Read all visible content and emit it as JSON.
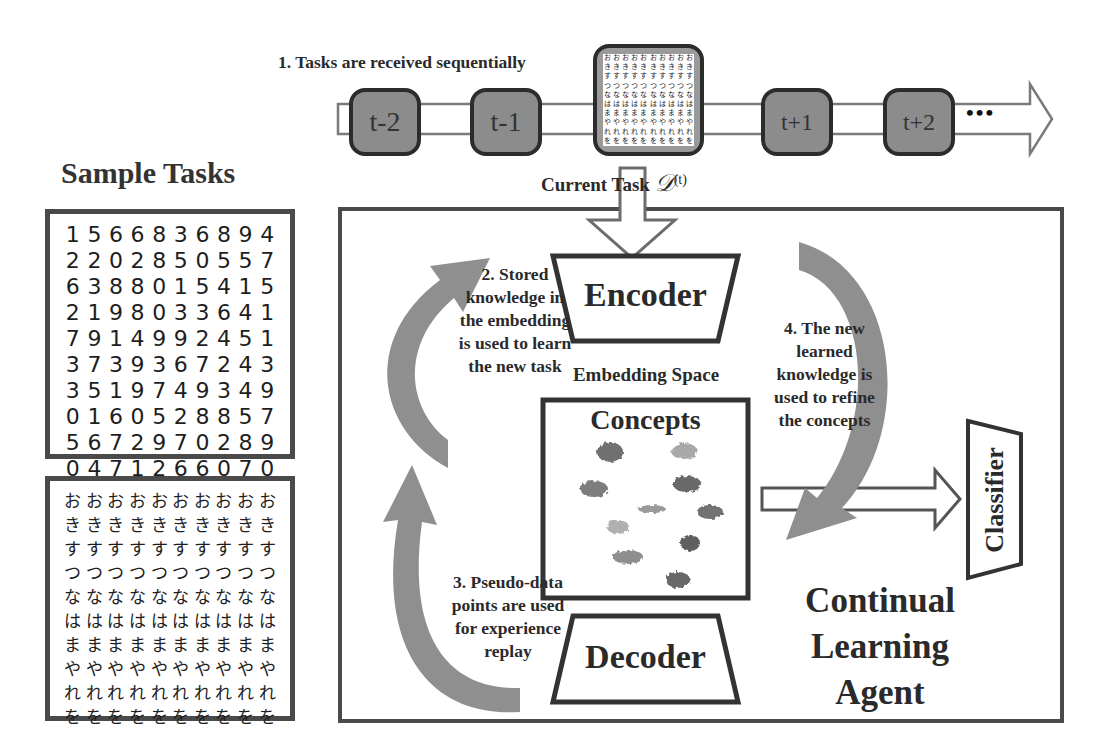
{
  "timeline": {
    "step_label": "1. Tasks are received sequentially",
    "tasks": [
      {
        "label": "t-2"
      },
      {
        "label": "t-1"
      },
      {
        "label": ""
      },
      {
        "label": "t+1"
      },
      {
        "label": "t+2"
      }
    ],
    "ellipsis": "•••",
    "current_task_label": "Current Task",
    "current_task_symbol": "𝒟",
    "current_task_superscript": "(t)"
  },
  "sample_tasks": {
    "title": "Sample Tasks",
    "mnist_rows": [
      [
        "1",
        "5",
        "6",
        "6",
        "8",
        "3",
        "6",
        "8",
        "9",
        "4"
      ],
      [
        "2",
        "2",
        "0",
        "2",
        "8",
        "5",
        "0",
        "5",
        "5",
        "7"
      ],
      [
        "6",
        "3",
        "8",
        "8",
        "0",
        "1",
        "5",
        "4",
        "1",
        "5"
      ],
      [
        "2",
        "1",
        "9",
        "8",
        "0",
        "3",
        "3",
        "6",
        "4",
        "1"
      ],
      [
        "7",
        "9",
        "1",
        "4",
        "9",
        "9",
        "2",
        "4",
        "5",
        "1"
      ],
      [
        "3",
        "7",
        "3",
        "9",
        "3",
        "6",
        "7",
        "2",
        "4",
        "3"
      ],
      [
        "3",
        "5",
        "1",
        "9",
        "7",
        "4",
        "9",
        "3",
        "4",
        "9"
      ],
      [
        "0",
        "1",
        "6",
        "0",
        "5",
        "2",
        "8",
        "8",
        "5",
        "7"
      ],
      [
        "5",
        "6",
        "7",
        "2",
        "9",
        "7",
        "0",
        "2",
        "8",
        "9"
      ],
      [
        "0",
        "4",
        "7",
        "1",
        "2",
        "6",
        "6",
        "0",
        "7",
        "0"
      ]
    ],
    "kana_reference_column": [
      "お",
      "き",
      "す",
      "つ",
      "な",
      "は",
      "ま",
      "や",
      "れ",
      "を"
    ],
    "kana_rows": [
      [
        "お",
        "お",
        "お",
        "お",
        "お",
        "お",
        "お",
        "お",
        "お",
        "お"
      ],
      [
        "き",
        "き",
        "き",
        "き",
        "き",
        "き",
        "き",
        "き",
        "き",
        "き"
      ],
      [
        "す",
        "す",
        "す",
        "す",
        "す",
        "す",
        "す",
        "す",
        "す",
        "す"
      ],
      [
        "つ",
        "つ",
        "つ",
        "つ",
        "つ",
        "つ",
        "つ",
        "つ",
        "つ",
        "つ"
      ],
      [
        "な",
        "な",
        "な",
        "な",
        "な",
        "な",
        "な",
        "な",
        "な",
        "な"
      ],
      [
        "は",
        "は",
        "は",
        "は",
        "は",
        "は",
        "は",
        "は",
        "は",
        "は"
      ],
      [
        "ま",
        "ま",
        "ま",
        "ま",
        "ま",
        "ま",
        "ま",
        "ま",
        "ま",
        "ま"
      ],
      [
        "や",
        "や",
        "や",
        "や",
        "や",
        "や",
        "や",
        "や",
        "や",
        "や"
      ],
      [
        "れ",
        "れ",
        "れ",
        "れ",
        "れ",
        "れ",
        "れ",
        "れ",
        "れ",
        "れ"
      ],
      [
        "を",
        "を",
        "を",
        "を",
        "を",
        "を",
        "を",
        "を",
        "を",
        "を"
      ]
    ]
  },
  "agent": {
    "encoder_label": "Encoder",
    "embedding_space_label": "Embedding Space",
    "concepts_label": "Concepts",
    "decoder_label": "Decoder",
    "classifier_label": "Classifier",
    "agent_title_lines": [
      "Continual",
      "Learning",
      "Agent"
    ],
    "step2_lines": [
      "2. Stored",
      "knowledge in",
      "the embedding",
      "is used to learn",
      "the new task"
    ],
    "step3_lines": [
      "3. Pseudo-data",
      "points are used",
      "for experience",
      "replay"
    ],
    "step4_lines": [
      "4. The new",
      "learned",
      "knowledge is",
      "used to refine",
      "the concepts"
    ]
  },
  "colors": {
    "task_box_fill": "#8c8c8c",
    "border_dark": "#3a3a3a",
    "curved_arrow": "#8f8f8f",
    "concept_blobs": [
      "#6f6f6f",
      "#a8a8a8",
      "#7d7d7d",
      "#696969",
      "#9a9a9a",
      "#727272",
      "#b0b0b0",
      "#5f5f5f",
      "#8e8e8e",
      "#676767"
    ]
  }
}
